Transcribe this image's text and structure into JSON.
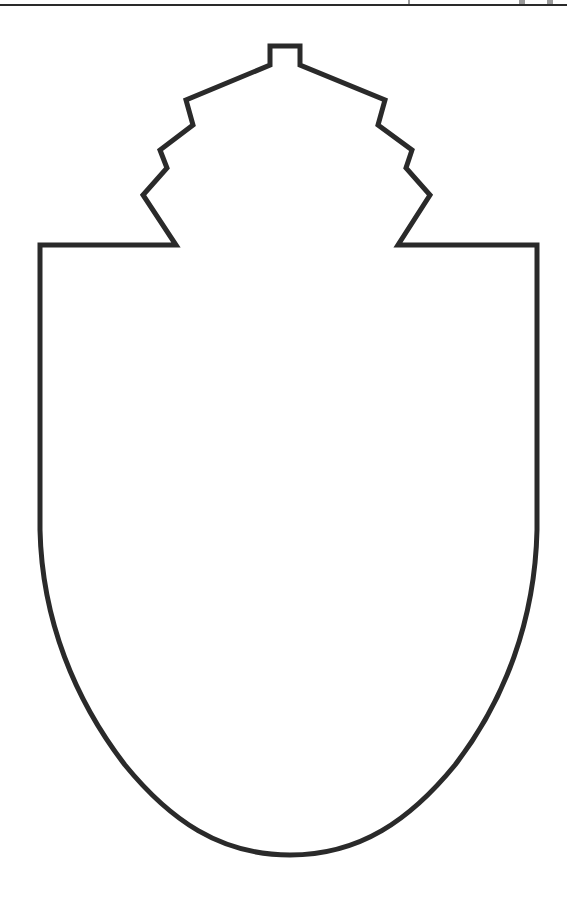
{
  "page": {
    "background": "#ffffff"
  },
  "header": {
    "rule_color": "#2a2a2a",
    "clipped_text_visible": false
  },
  "figure": {
    "type": "shield-outline",
    "stroke_color": "#2a2a2a",
    "fill_color": "#ffffff",
    "stroke_width": 5,
    "crown": {
      "tab_top": 46,
      "steps_per_side": 4
    },
    "body": {
      "left": 40,
      "right": 537,
      "shoulder_y": 245,
      "curve_start_y": 530,
      "bottom_point_y": 855
    }
  }
}
